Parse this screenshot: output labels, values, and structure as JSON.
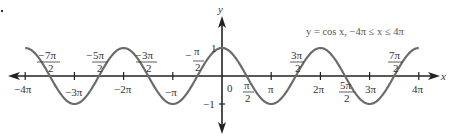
{
  "chart_data": {
    "type": "line",
    "title": "y = cos x, −4π ≤ x ≤ 4π",
    "function": "cos",
    "xlabel": "x",
    "ylabel": "y",
    "xlim": [
      -12.566,
      12.566
    ],
    "ylim": [
      -1,
      1
    ],
    "grid": false,
    "legend": null,
    "series": [
      {
        "name": "y = cos x",
        "x": [
          -12.566,
          -10.996,
          -9.425,
          -7.854,
          -6.283,
          -4.712,
          -3.142,
          -1.571,
          0,
          1.571,
          3.142,
          4.712,
          6.283,
          7.854,
          9.425,
          10.996,
          12.566
        ],
        "values": [
          1,
          0,
          -1,
          0,
          1,
          0,
          -1,
          0,
          1,
          0,
          -1,
          0,
          1,
          0,
          -1,
          0,
          1
        ]
      }
    ],
    "x_tick_labels_below": [
      "−4π",
      "−3π",
      "−2π",
      "−π",
      "0",
      "π",
      "2π",
      "3π",
      "4π"
    ],
    "x_tick_labels_above": [
      "−7π/2",
      "−5π/2",
      "−3π/2",
      "−π/2"
    ],
    "x_tick_labels_fraction_below": [
      "π/2",
      "5π/2"
    ],
    "x_tick_labels_fraction_above": [
      "3π/2",
      "7π/2"
    ],
    "y_tick_labels": [
      "1",
      "−1"
    ]
  },
  "labels": {
    "title": "y = cos x, −4π ≤ x ≤ 4π",
    "x_axis": "x",
    "y_axis": "y",
    "origin": "0",
    "y_one": "1",
    "y_neg_one": "−1",
    "neg4pi": "−4π",
    "neg3pi": "−3π",
    "neg2pi": "−2π",
    "negpi": "−π",
    "pi": "π",
    "twopi": "2π",
    "threepi": "3π",
    "fourpi": "4π",
    "frac_neg7": {
      "sign": "−",
      "num": "7π",
      "den": "2"
    },
    "frac_neg5": {
      "sign": "−",
      "num": "5π",
      "den": "2"
    },
    "frac_neg3": {
      "sign": "−",
      "num": "3π",
      "den": "2"
    },
    "frac_neg1": {
      "sign": "−",
      "num": "π",
      "den": "2"
    },
    "frac_pos1": {
      "num": "π",
      "den": "2"
    },
    "frac_pos3": {
      "num": "3π",
      "den": "2"
    },
    "frac_pos5": {
      "num": "5π",
      "den": "2"
    },
    "frac_pos7": {
      "num": "7π",
      "den": "2"
    }
  },
  "colors": {
    "curve": "#6b6b6b",
    "axis": "#222222",
    "text": "#333333"
  }
}
